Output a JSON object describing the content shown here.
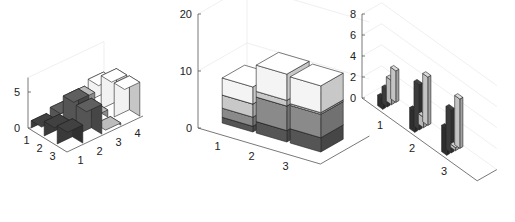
{
  "chart_data": [
    {
      "type": "bar",
      "style": "detached-3d",
      "title": "",
      "xlabel": "",
      "ylabel": "",
      "zlabel": "",
      "rows": [
        "1",
        "2",
        "3"
      ],
      "columns": [
        "1",
        "2",
        "3",
        "4"
      ],
      "zlim": [
        0,
        7
      ],
      "zticks": [
        "0",
        "5"
      ],
      "series": [
        {
          "name": "1",
          "values": [
            1,
            2,
            2.5
          ]
        },
        {
          "name": "2",
          "values": [
            1.6,
            4.3,
            4.1
          ]
        },
        {
          "name": "3",
          "values": [
            2.3,
            1,
            0.3
          ]
        },
        {
          "name": "4",
          "values": [
            3,
            4.6,
            4.7
          ]
        }
      ],
      "colors": [
        "#3a3a3a",
        "#555555",
        "#a8a8a8",
        "#f2f2f2"
      ],
      "grid": true
    },
    {
      "type": "bar",
      "style": "stacked-3d",
      "title": "",
      "categories": [
        "1",
        "2",
        "3"
      ],
      "zlim": [
        0,
        20
      ],
      "zticks": [
        "0",
        "10",
        "20"
      ],
      "series": [
        {
          "name": "1",
          "values": [
            1,
            2,
            2.5
          ]
        },
        {
          "name": "2",
          "values": [
            1.6,
            4.3,
            4.1
          ]
        },
        {
          "name": "3",
          "values": [
            2.3,
            1,
            0.3
          ]
        },
        {
          "name": "4",
          "values": [
            3,
            4.6,
            4.7
          ]
        }
      ],
      "colors": [
        "#555555",
        "#8a8a8a",
        "#c8c8c8",
        "#f4f4f4"
      ],
      "grid": true
    },
    {
      "type": "bar",
      "style": "grouped-3d",
      "title": "",
      "categories": [
        "1",
        "2",
        "3"
      ],
      "zlim": [
        0,
        8
      ],
      "zticks": [
        "0",
        "2",
        "4",
        "6",
        "8"
      ],
      "series": [
        {
          "name": "1",
          "values": [
            1,
            2,
            2.5
          ]
        },
        {
          "name": "2",
          "values": [
            1.6,
            4.3,
            4.1
          ]
        },
        {
          "name": "3",
          "values": [
            2.3,
            1,
            0.3
          ]
        },
        {
          "name": "4",
          "values": [
            3,
            4.6,
            4.7
          ]
        }
      ],
      "colors": [
        "#2e2e2e",
        "#3c3c3c",
        "#b8b8b8",
        "#c4c4c4"
      ],
      "grid": true
    }
  ]
}
